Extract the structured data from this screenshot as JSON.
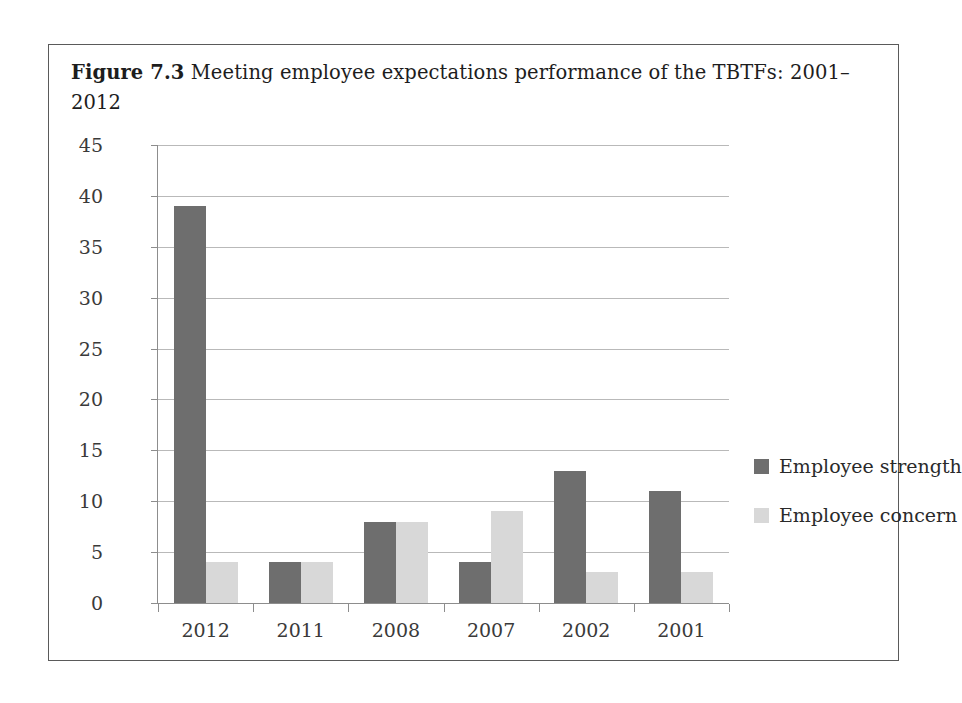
{
  "caption": {
    "label": "Figure 7.3",
    "text": "Meeting employee expectations performance of the TBTFs: 2001–2012"
  },
  "chart_data": {
    "type": "bar",
    "title": "Meeting employee expectations performance of the TBTFs: 2001–2012",
    "categories": [
      "2012",
      "2011",
      "2008",
      "2007",
      "2002",
      "2001"
    ],
    "series": [
      {
        "name": "Employee strength",
        "color": "#6e6e6e",
        "values": [
          39,
          4,
          8,
          4,
          13,
          11
        ]
      },
      {
        "name": "Employee concern",
        "color": "#d8d8d8",
        "values": [
          4,
          4,
          8,
          9,
          3,
          3
        ]
      }
    ],
    "xlabel": "",
    "ylabel": "",
    "ylim": [
      0,
      45
    ],
    "ytick_step": 5,
    "yticks": [
      "45",
      "40",
      "35",
      "30",
      "25",
      "20",
      "15",
      "10",
      "5",
      "0"
    ],
    "grid": true,
    "legend_position": "right"
  }
}
